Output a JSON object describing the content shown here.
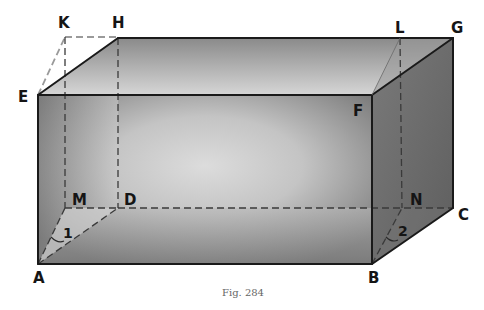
{
  "figure": {
    "caption": "Fig. 284",
    "type": "rectangular solid (box) with hidden edges and diagonal planes",
    "vertices": {
      "A": {
        "label": "A"
      },
      "B": {
        "label": "B"
      },
      "C": {
        "label": "C"
      },
      "D": {
        "label": "D"
      },
      "E": {
        "label": "E"
      },
      "F": {
        "label": "F"
      },
      "G": {
        "label": "G"
      },
      "H": {
        "label": "H"
      },
      "K": {
        "label": "K"
      },
      "L": {
        "label": "L"
      },
      "M": {
        "label": "M"
      },
      "N": {
        "label": "N"
      }
    },
    "angles": [
      {
        "label": "1",
        "vertex": "A",
        "between": [
          "AM",
          "AD"
        ]
      },
      {
        "label": "2",
        "vertex": "B",
        "between": [
          "BN",
          "BC"
        ]
      }
    ],
    "colors": {
      "edge": "#1a1a1a",
      "hidden_edge": "#3a3a3a",
      "face_dark": "#6e6e6e",
      "face_light": "#d8d8d8",
      "background": "#ffffff"
    }
  }
}
